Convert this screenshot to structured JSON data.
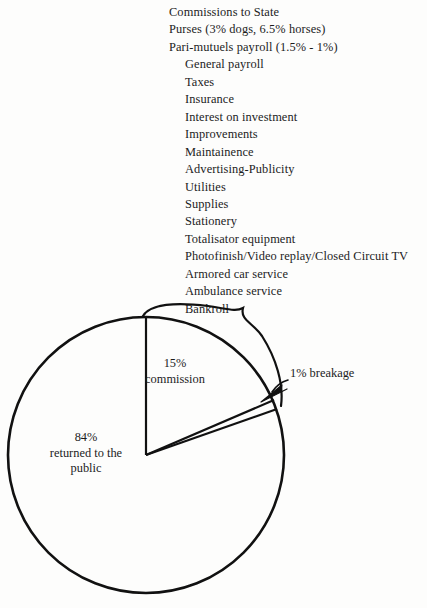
{
  "figure": {
    "breakdown_list": [
      {
        "text": "Commissions to State",
        "indent": false
      },
      {
        "text": "Purses (3% dogs, 6.5% horses)",
        "indent": false
      },
      {
        "text": "Pari-mutuels payroll (1.5% - 1%)",
        "indent": false
      },
      {
        "text": "General payroll",
        "indent": true
      },
      {
        "text": "Taxes",
        "indent": true
      },
      {
        "text": "Insurance",
        "indent": true
      },
      {
        "text": "Interest on investment",
        "indent": true
      },
      {
        "text": "Improvements",
        "indent": true
      },
      {
        "text": "Maintainence",
        "indent": true
      },
      {
        "text": "Advertising-Publicity",
        "indent": true
      },
      {
        "text": "Utilities",
        "indent": true
      },
      {
        "text": "Supplies",
        "indent": true
      },
      {
        "text": "Stationery",
        "indent": true
      },
      {
        "text": "Totalisator equipment",
        "indent": true
      },
      {
        "text": "Photofinish/Video replay/Closed Circuit TV",
        "indent": true
      },
      {
        "text": "Armored car service",
        "indent": true
      },
      {
        "text": "Ambulance service",
        "indent": true
      },
      {
        "text": "Bankroll",
        "indent": true
      }
    ],
    "labels": {
      "commission_pct": "15%",
      "commission_word": "commission",
      "public_pct": "84%",
      "public_line2": "returned to the",
      "public_line3": "public",
      "breakage": "1% breakage"
    },
    "colors": {
      "ink": "#1a1a1a",
      "paper": "#fdfdfc"
    }
  },
  "chart_data": {
    "type": "pie",
    "categories": [
      "84% returned to the public",
      "15% commission",
      "1% breakage"
    ],
    "values": [
      84,
      15,
      1
    ],
    "labels": [
      "84%\nreturned to the\npublic",
      "15%\ncommission",
      "1% breakage"
    ],
    "units": "percent",
    "legend": "none",
    "annotations": [
      "Brace from commission slice points to itemized list of commission components",
      "Arrow points to the 1% breakage slice"
    ],
    "start_angle_deg": 90,
    "direction": "clockwise",
    "grid": false
  }
}
